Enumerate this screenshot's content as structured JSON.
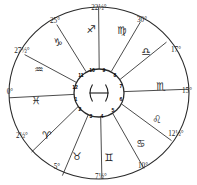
{
  "chart": {
    "type": "zodiac-wheel",
    "center_sign": {
      "name": "pisces",
      "glyph": "♓"
    },
    "geometry": {
      "center_x": 99,
      "center_y": 93,
      "outer_radius_x": 92,
      "outer_radius_y": 88,
      "inner_radius": 25
    },
    "colors": {
      "line": "#2b2b2b",
      "background": "#ffffff",
      "text": "#1a1a1a"
    },
    "cusp_degrees": [
      {
        "label": "0°",
        "x": 10,
        "y": 93
      },
      {
        "label": "2½°",
        "x": 22,
        "y": 137
      },
      {
        "label": "5°",
        "x": 57,
        "y": 168
      },
      {
        "label": "7½°",
        "x": 101,
        "y": 178
      },
      {
        "label": "10°",
        "x": 143,
        "y": 167
      },
      {
        "label": "12½°",
        "x": 176,
        "y": 135
      },
      {
        "label": "15°",
        "x": 187,
        "y": 92
      },
      {
        "label": "17°",
        "x": 176,
        "y": 51
      },
      {
        "label": "30°",
        "x": 142,
        "y": 21
      },
      {
        "label": "22½°",
        "x": 99,
        "y": 9
      },
      {
        "label": "25°",
        "x": 55,
        "y": 22
      },
      {
        "label": "27½°",
        "x": 22,
        "y": 52
      }
    ],
    "signs": [
      {
        "name": "pisces",
        "glyph": "♓",
        "x": 36,
        "y": 100
      },
      {
        "name": "aries",
        "glyph": "♈",
        "x": 47,
        "y": 135
      },
      {
        "name": "taurus",
        "glyph": "♉",
        "x": 77,
        "y": 156
      },
      {
        "name": "gemini",
        "glyph": "♊",
        "x": 109,
        "y": 157
      },
      {
        "name": "cancer",
        "glyph": "♋",
        "x": 141,
        "y": 143
      },
      {
        "name": "leo",
        "glyph": "♌",
        "x": 157,
        "y": 119
      },
      {
        "name": "scorpio",
        "glyph": "♏",
        "x": 161,
        "y": 86
      },
      {
        "name": "libra",
        "glyph": "♎",
        "x": 146,
        "y": 51
      },
      {
        "name": "virgo",
        "glyph": "♍",
        "x": 122,
        "y": 30
      },
      {
        "name": "sagittarius",
        "glyph": "♐",
        "x": 91,
        "y": 29
      },
      {
        "name": "capricorn",
        "glyph": "♑",
        "x": 58,
        "y": 42
      },
      {
        "name": "aquarius",
        "glyph": "♒",
        "x": 39,
        "y": 69
      }
    ],
    "houses": [
      {
        "number": "1",
        "x": 76,
        "y": 100
      },
      {
        "number": "2",
        "x": 80,
        "y": 110
      },
      {
        "number": "3",
        "x": 91,
        "y": 117
      },
      {
        "number": "4",
        "x": 102,
        "y": 117
      },
      {
        "number": "5",
        "x": 113,
        "y": 111
      },
      {
        "number": "6",
        "x": 121,
        "y": 100
      },
      {
        "number": "7",
        "x": 121,
        "y": 87
      },
      {
        "number": "8",
        "x": 115,
        "y": 76
      },
      {
        "number": "9",
        "x": 104,
        "y": 71
      },
      {
        "number": "10",
        "x": 92,
        "y": 71
      },
      {
        "number": "11",
        "x": 81,
        "y": 76
      },
      {
        "number": "12",
        "x": 75,
        "y": 88
      }
    ]
  }
}
